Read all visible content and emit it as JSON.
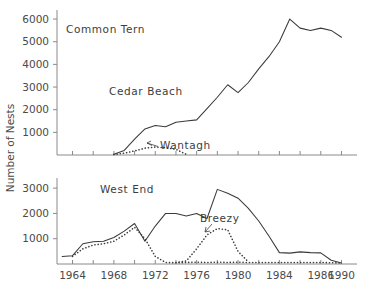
{
  "figure": {
    "ylabel": "Number of Nests",
    "background_color": "#ffffff",
    "line_color": "#3a3a3a",
    "axis_color": "#8a8a8a"
  },
  "panels": [
    {
      "name": "top",
      "title": "Common Tern",
      "ylim": [
        0,
        6400
      ],
      "yticks": [
        1000,
        2000,
        3000,
        4000,
        5000,
        6000
      ],
      "ytick_labels": [
        "1000",
        "2000",
        "3000",
        "4000",
        "5000",
        "6000"
      ],
      "xtick_labels": []
    },
    {
      "name": "bottom",
      "title": "West End",
      "ylim": [
        0,
        3400
      ],
      "yticks": [
        1000,
        2000,
        3000
      ],
      "ytick_labels": [
        "1000",
        "2000",
        "3000"
      ],
      "xtick_labels": [
        "1964",
        "1968",
        "1972",
        "1976",
        "1980",
        "1984",
        "1986",
        "1990"
      ]
    }
  ],
  "axis": {
    "xlim": [
      1962.5,
      1991.5
    ],
    "xticks": [
      1964,
      1966,
      1968,
      1970,
      1972,
      1974,
      1976,
      1978,
      1980,
      1982,
      1984,
      1986,
      1988,
      1990
    ],
    "xtick_label_values": [
      1964,
      1968,
      1972,
      1976,
      1980,
      1984,
      1988,
      1990
    ],
    "xtick_label_text": [
      "1964",
      "1968",
      "1972",
      "1976",
      "1980",
      "1984",
      "1986",
      "1990"
    ]
  },
  "annotations": {
    "common_tern": "Common Tern",
    "cedar_beach": "Cedar Beach",
    "wantagh": "Wantagh",
    "west_end": "West End",
    "breezy": "Breezy"
  },
  "chart_data": {
    "type": "line",
    "title": "Number of Nests",
    "xlabel": "",
    "ylabel": "Number of Nests",
    "grid": false,
    "legend": "inline annotations",
    "panels": [
      {
        "panel": "Common Tern",
        "ylim": [
          0,
          6400
        ],
        "yticks": [
          1000,
          2000,
          3000,
          4000,
          5000,
          6000
        ],
        "series": [
          {
            "name": "Cedar Beach",
            "style": "solid",
            "x": [
              1968,
              1969,
              1970,
              1971,
              1972,
              1973,
              1974,
              1975,
              1976,
              1977,
              1978,
              1979,
              1980,
              1981,
              1982,
              1983,
              1984,
              1985,
              1986,
              1987,
              1988,
              1989,
              1990
            ],
            "y": [
              30,
              200,
              700,
              1150,
              1300,
              1250,
              1450,
              1500,
              1550,
              2050,
              2550,
              3100,
              2750,
              3200,
              3800,
              4350,
              5000,
              6000,
              5600,
              5500,
              5600,
              5500,
              5200
            ]
          },
          {
            "name": "Wantagh",
            "style": "dotted",
            "x": [
              1968,
              1969,
              1970,
              1971,
              1972,
              1973,
              1974,
              1975
            ],
            "y": [
              20,
              80,
              180,
              300,
              350,
              320,
              250,
              30
            ]
          }
        ]
      },
      {
        "panel": "West End",
        "ylim": [
          0,
          3400
        ],
        "yticks": [
          1000,
          2000,
          3000
        ],
        "series": [
          {
            "name": "West End",
            "style": "solid",
            "x": [
              1963,
              1964,
              1965,
              1966,
              1967,
              1968,
              1969,
              1970,
              1971,
              1972,
              1973,
              1974,
              1975,
              1976,
              1977,
              1978,
              1979,
              1980,
              1981,
              1982,
              1983,
              1984,
              1985,
              1986,
              1987,
              1988,
              1989,
              1990
            ],
            "y": [
              300,
              330,
              800,
              880,
              900,
              1050,
              1300,
              1600,
              900,
              1500,
              2000,
              2000,
              1900,
              2000,
              1800,
              2950,
              2800,
              2600,
              2200,
              1700,
              1100,
              450,
              430,
              480,
              450,
              440,
              150,
              40
            ]
          },
          {
            "name": "Breezy",
            "style": "dotted",
            "x": [
              1964,
              1965,
              1966,
              1967,
              1968,
              1969,
              1970,
              1971,
              1972,
              1973,
              1974,
              1975,
              1976,
              1977,
              1978,
              1979,
              1980,
              1981,
              1982,
              1983,
              1984,
              1985,
              1986,
              1987,
              1988,
              1989,
              1990
            ],
            "y": [
              300,
              600,
              750,
              800,
              900,
              1150,
              1450,
              1000,
              300,
              60,
              50,
              60,
              70,
              60,
              70,
              60,
              70,
              60,
              60,
              60,
              60,
              60,
              60,
              60,
              60,
              50,
              40
            ]
          },
          {
            "name": "Breezy (secondary rise)",
            "style": "dotted",
            "x": [
              1974,
              1975,
              1976,
              1977,
              1978,
              1979,
              1980,
              1981
            ],
            "y": [
              60,
              120,
              600,
              1150,
              1400,
              1350,
              500,
              80
            ]
          }
        ]
      }
    ]
  }
}
